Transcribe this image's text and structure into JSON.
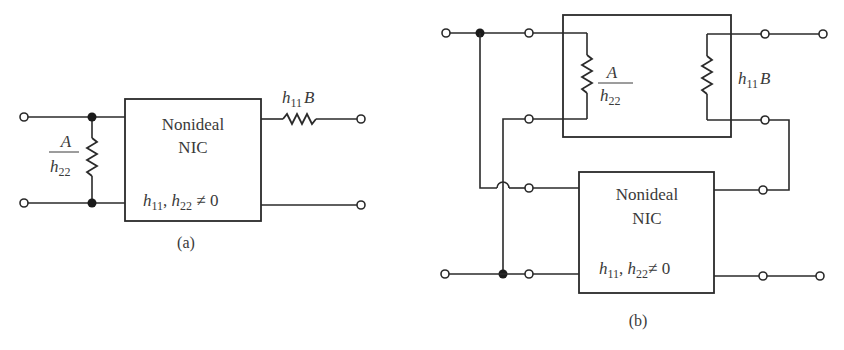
{
  "figure_a": {
    "block": {
      "line1": "Nonideal",
      "line2": "NIC",
      "condition": {
        "h": "h",
        "sub1": "11",
        "sep": ", ",
        "h2": "h",
        "sub2": "22",
        "rel": " ≠ 0"
      }
    },
    "shunt_resistor": {
      "num": "A",
      "den_h": "h",
      "den_sub": "22"
    },
    "series_resistor": {
      "h": "h",
      "sub": "11",
      "var": "B"
    },
    "caption": "(a)"
  },
  "figure_b": {
    "upper_block": {
      "left_resistor": {
        "num": "A",
        "den_h": "h",
        "den_sub": "22"
      },
      "right_resistor": {
        "h": "h",
        "sub": "11",
        "var": "B"
      }
    },
    "lower_block": {
      "line1": "Nonideal",
      "line2": "NIC",
      "condition": {
        "h": "h",
        "sub1": "11",
        "sep": ", ",
        "h2": "h",
        "sub2": "22",
        "rel": "≠ 0"
      }
    },
    "caption": "(b)"
  }
}
